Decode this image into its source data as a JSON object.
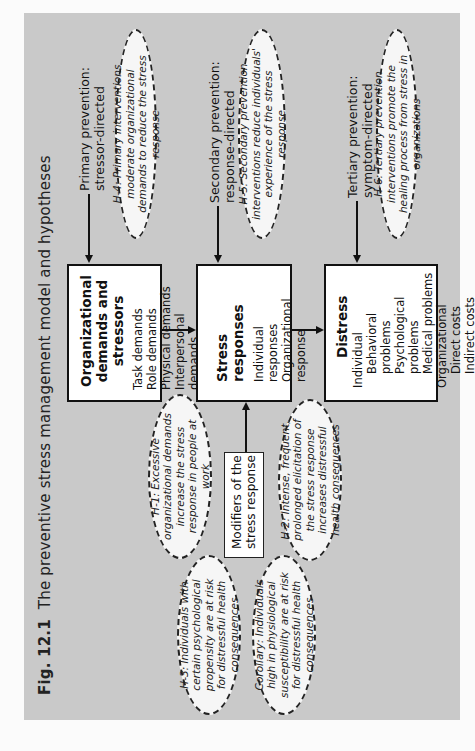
{
  "figure": {
    "number": "Fig. 12.1",
    "title": "The preventive stress management model and hypotheses"
  },
  "prevention_labels": {
    "primary": [
      "Primary prevention:",
      "stressor-directed"
    ],
    "secondary": [
      "Secondary prevention:",
      "response-directed"
    ],
    "tertiary": [
      "Tertiary prevention:",
      "symptom-directed"
    ]
  },
  "boxes": {
    "demands": {
      "heading": [
        "Organizational",
        "demands and stressors"
      ],
      "items": [
        "Task demands",
        "Role demands",
        "Physical demands",
        "Interpersonal demands"
      ]
    },
    "responses": {
      "heading": "Stress responses",
      "items": [
        "Individual responses",
        "Organizational response"
      ]
    },
    "distress": {
      "heading": "Distress",
      "items": [
        "Individual",
        "Behavioral problems",
        "Psychological problems",
        "Medical problems",
        "Organizational",
        "Direct costs",
        "Indirect costs"
      ]
    },
    "modifiers": [
      "Modifiers of the",
      "stress response"
    ]
  },
  "hypotheses": {
    "h1": "H-1: Excessive organizational demands increase the stress response in people at work",
    "h2": "H-2: Intense, frequent, prolonged elicitation of the stress response increases distressful health consequences",
    "h3": "H-3: Individuals with certain psychological propensity are at risk for distressful health consequences",
    "corollary": "Corollary: Individuals high in physiological susceptibility are at risk for distressful health consequences",
    "h4": "H-4: Primary interventions moderate organizational demands to reduce the stress response",
    "h5": "H-5: Secondary prevention interventions reduce individuals' experience of the stress response",
    "h6": "H-6: Tertiary prevention interventions promote the healing process from stress in organizations"
  },
  "colors": {
    "panel": "#c9c9c9",
    "box": "#ffffff",
    "border": "#111111"
  }
}
